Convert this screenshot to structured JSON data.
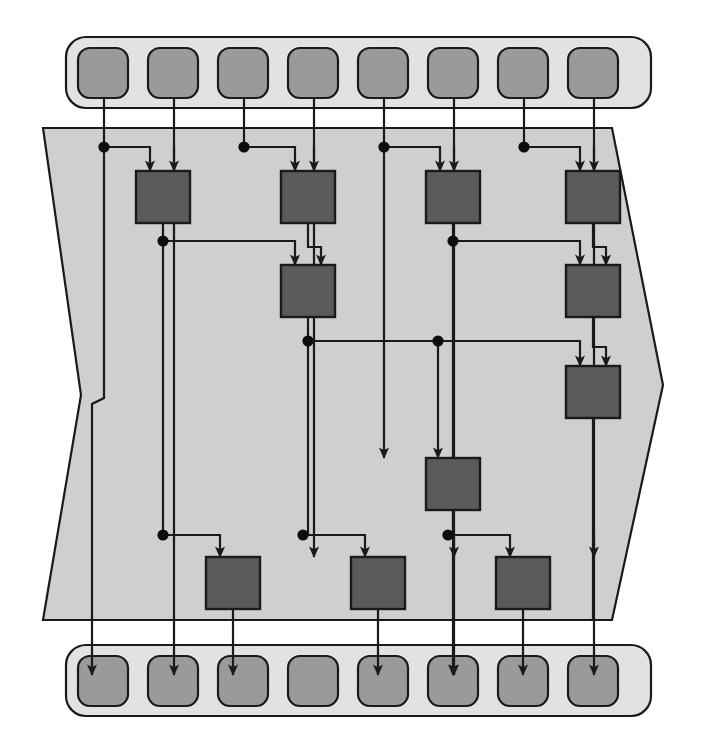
{
  "diagram": {
    "type": "butterfly-merge-network",
    "canvas": {
      "width": 706,
      "height": 754
    },
    "colors": {
      "background": "#ffffff",
      "band_fill": "#e2e2e2",
      "band_stroke": "#1a1a1a",
      "region_fill": "#cfcfcf",
      "region_stroke": "#1a1a1a",
      "node_fill": "#9a9a9a",
      "node_stroke": "#1a1a1a",
      "processor_fill": "#5a5a5a",
      "processor_stroke": "#1a1a1a",
      "wire_stroke": "#1a1a1a",
      "junction_fill": "#0d0d0d"
    },
    "stroke_widths": {
      "band": 2.2,
      "region": 2.2,
      "node": 2.2,
      "processor": 2.4,
      "wire": 2.2
    },
    "input_band": {
      "label": "input-register-bank",
      "x": 66,
      "y": 37,
      "width": 585,
      "height": 71,
      "radius": 20,
      "node_count": 8,
      "node_width": 50,
      "node_height": 50,
      "node_radius": 12,
      "node_y": 48,
      "nodes": [
        {
          "name": "input-node-0",
          "x": 78
        },
        {
          "name": "input-node-1",
          "x": 148
        },
        {
          "name": "input-node-2",
          "x": 218
        },
        {
          "name": "input-node-3",
          "x": 288
        },
        {
          "name": "input-node-4",
          "x": 358
        },
        {
          "name": "input-node-5",
          "x": 428
        },
        {
          "name": "input-node-6",
          "x": 498
        },
        {
          "name": "input-node-7",
          "x": 568
        }
      ]
    },
    "output_band": {
      "label": "output-register-bank",
      "x": 66,
      "y": 645,
      "width": 585,
      "height": 71,
      "radius": 20,
      "node_count": 8,
      "node_width": 50,
      "node_height": 50,
      "node_radius": 12,
      "node_y": 656,
      "nodes": [
        {
          "name": "output-node-0",
          "x": 78
        },
        {
          "name": "output-node-1",
          "x": 148
        },
        {
          "name": "output-node-2",
          "x": 218
        },
        {
          "name": "output-node-3",
          "x": 288
        },
        {
          "name": "output-node-4",
          "x": 358
        },
        {
          "name": "output-node-5",
          "x": 428
        },
        {
          "name": "output-node-6",
          "x": 498
        },
        {
          "name": "output-node-7",
          "x": 568
        }
      ]
    },
    "region": {
      "label": "processing-region",
      "points": "43,128 612,128 663,385 612,620 43,620 81,395"
    },
    "lanes": {
      "label": "vertical-wire-lanes",
      "x": [
        104,
        174,
        244,
        314,
        384,
        454,
        524,
        594
      ]
    },
    "processors": [
      {
        "name": "processor-a1",
        "x": 136,
        "y": 171,
        "width": 54,
        "height": 52
      },
      {
        "name": "processor-a2",
        "x": 281,
        "y": 171,
        "width": 54,
        "height": 52
      },
      {
        "name": "processor-a3",
        "x": 426,
        "y": 171,
        "width": 54,
        "height": 52
      },
      {
        "name": "processor-a4",
        "x": 566,
        "y": 171,
        "width": 54,
        "height": 52
      },
      {
        "name": "processor-b1",
        "x": 281,
        "y": 265,
        "width": 54,
        "height": 52
      },
      {
        "name": "processor-b2",
        "x": 566,
        "y": 265,
        "width": 54,
        "height": 52
      },
      {
        "name": "processor-c1",
        "x": 566,
        "y": 366,
        "width": 54,
        "height": 52
      },
      {
        "name": "processor-d1",
        "x": 426,
        "y": 458,
        "width": 54,
        "height": 52
      },
      {
        "name": "processor-e1",
        "x": 206,
        "y": 557,
        "width": 54,
        "height": 52
      },
      {
        "name": "processor-e2",
        "x": 351,
        "y": 557,
        "width": 54,
        "height": 52
      },
      {
        "name": "processor-e3",
        "x": 496,
        "y": 557,
        "width": 54,
        "height": 52
      }
    ],
    "junctions": [
      {
        "name": "junction-l0-t",
        "x": 104,
        "y": 147
      },
      {
        "name": "junction-l2-t",
        "x": 244,
        "y": 147
      },
      {
        "name": "junction-l4-t",
        "x": 384,
        "y": 147
      },
      {
        "name": "junction-l6-t",
        "x": 524,
        "y": 147
      },
      {
        "name": "junction-a1-out",
        "x": 163,
        "y": 241
      },
      {
        "name": "junction-a3-out",
        "x": 453,
        "y": 241
      },
      {
        "name": "junction-b1-out",
        "x": 308,
        "y": 341
      },
      {
        "name": "junction-b2-out",
        "x": 438,
        "y": 341
      },
      {
        "name": "junction-l2-lo",
        "x": 163,
        "y": 535
      },
      {
        "name": "junction-l4-lo",
        "x": 303,
        "y": 535
      },
      {
        "name": "junction-l6-lo",
        "x": 448,
        "y": 535
      }
    ],
    "legend": {
      "input_label": "inputs",
      "output_label": "outputs",
      "stage_labels": [
        "stage 1",
        "stage 2",
        "stage 3",
        "stage 4"
      ]
    }
  }
}
